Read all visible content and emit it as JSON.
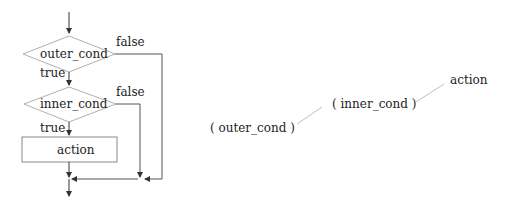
{
  "flowchart": {
    "outer_condition": "outer_cond",
    "inner_condition": "inner_cond",
    "action": "action",
    "outer_true_label": "true",
    "outer_false_label": "false",
    "inner_true_label": "true",
    "inner_false_label": "false"
  },
  "tree": {
    "node_outer": "( outer_cond )",
    "node_inner": "( inner_cond )",
    "node_action": "action"
  },
  "colors": {
    "shape_stroke": "#b0b0b0",
    "arrow_stroke": "#333333",
    "tree_edge": "#c0c0c0"
  }
}
